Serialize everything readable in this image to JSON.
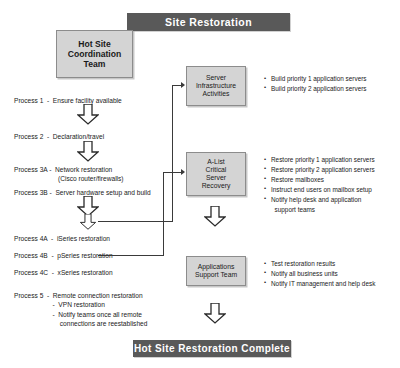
{
  "title_banner": "Site Restoration",
  "complete_banner": "Hot Site Restoration Complete",
  "boxes": {
    "hot_site": "Hot Site\nCoordination\nTeam",
    "server_infrastructure": "Server\nInfrastructure\nActivities",
    "alist": "A-List\nCritical\nServer\nRecovery",
    "apps_support": "Applications\nSupport Team"
  },
  "processes": {
    "p1": "Process 1  -  Ensure facility available",
    "p2": "Process 2  -  Declaration/travel",
    "p3a": "Process 3A -  Network restoration\n                        (Cisco router/firewalls)",
    "p3b": "Process 3B -  Server hardware setup and build",
    "p4a": "Process 4A  -  iSeries restoration",
    "p4b": "Process 4B  -  pSeries restoration",
    "p4c": "Process 4C  -  xSeries restoration",
    "p5": "Process 5  -  Remote connection restoration\n                     -  VPN restoration\n                     -  Notify teams once all remote\n                         connections are reestablished"
  },
  "bullets": {
    "server_infrastructure": [
      "Build priority 1 application servers",
      "Build priority 2 application servers"
    ],
    "alist": [
      "Restore priority 1 application servers",
      "Restore priority 2 application servers",
      "Restore mailboxes",
      "Instruct end users on mailbox setup",
      "Notify help desk and application\n  support teams"
    ],
    "apps_support": [
      "Test restoration results",
      "Notify all business units",
      "Notify IT management and help desk"
    ]
  },
  "colors": {
    "banner": "#595959",
    "box_fill": "#d4d4d4",
    "box_border": "#8c8c8c",
    "line": "#3a3a3a"
  }
}
